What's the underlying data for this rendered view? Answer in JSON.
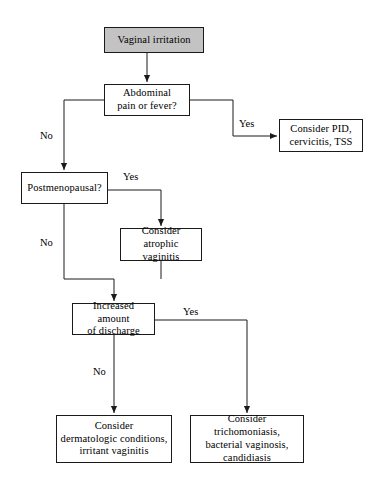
{
  "diagram": {
    "type": "clinical-decision-flowchart",
    "canvas": {
      "width": 386,
      "height": 490
    },
    "colors": {
      "start_fill": "#c3c3c3",
      "node_fill": "#ffffff",
      "stroke": "#1a1a1a",
      "text": "#000000",
      "background": "#ffffff"
    }
  },
  "nodes": [
    {
      "id": "start",
      "kind": "start",
      "text": "Vaginal irritation",
      "x": 104,
      "y": 27,
      "w": 100,
      "h": 26
    },
    {
      "id": "abdominal",
      "kind": "decision",
      "text": "Abdominal\npain or fever?",
      "x": 104,
      "y": 84,
      "w": 86,
      "h": 32
    },
    {
      "id": "consider_pid",
      "kind": "outcome",
      "text": "Consider PID,\ncervicitis, TSS",
      "x": 279,
      "y": 119,
      "w": 84,
      "h": 33
    },
    {
      "id": "postmenopausal",
      "kind": "decision",
      "text": "Postmenopausal?",
      "x": 21,
      "y": 172,
      "w": 87,
      "h": 32
    },
    {
      "id": "atrophic",
      "kind": "outcome",
      "text": "Consider\natrophic vaginitis",
      "x": 120,
      "y": 228,
      "w": 82,
      "h": 33
    },
    {
      "id": "discharge",
      "kind": "decision",
      "text": "Increased amount\nof discharge",
      "x": 72,
      "y": 303,
      "w": 83,
      "h": 32
    },
    {
      "id": "dermatologic",
      "kind": "outcome",
      "text": "Consider\ndermatologic conditions,\nirritant vaginitis",
      "x": 56,
      "y": 415,
      "w": 116,
      "h": 48
    },
    {
      "id": "trichomoniasis",
      "kind": "outcome",
      "text": "Consider trichomoniasis,\nbacterial vaginosis,\ncandidiasis",
      "x": 190,
      "y": 415,
      "w": 114,
      "h": 48
    }
  ],
  "edges": [
    {
      "id": "start-to-abdominal",
      "from": "start",
      "to": "abdominal",
      "label": "",
      "points": "147,53 147,82",
      "arrow": true
    },
    {
      "id": "abdominal-no-to-postmenopausal",
      "from": "abdominal",
      "to": "postmenopausal",
      "label": "No",
      "points": "104,100 64,100 64,170",
      "arrow": true
    },
    {
      "id": "abdominal-yes-to-pid",
      "from": "abdominal",
      "to": "consider_pid",
      "label": "Yes",
      "points": "190,100 233,100 233,136 277,136",
      "arrow": true
    },
    {
      "id": "postmenopausal-yes-to-atrophic",
      "from": "postmenopausal",
      "to": "atrophic",
      "label": "Yes",
      "points": "108,190 161,190 161,226",
      "arrow": true
    },
    {
      "id": "postmenopausal-no-to-discharge",
      "from": "postmenopausal",
      "to": "discharge",
      "label": "No",
      "points": "64,204 64,279 114,279 114,301",
      "arrow": true
    },
    {
      "id": "atrophic-to-discharge",
      "from": "atrophic",
      "to": "discharge",
      "label": "",
      "points": "161,261 161,279",
      "arrow": false
    },
    {
      "id": "discharge-no-to-dermatologic",
      "from": "discharge",
      "to": "dermatologic",
      "label": "No",
      "points": "114,335 114,413",
      "arrow": true
    },
    {
      "id": "discharge-yes-to-trichomoniasis",
      "from": "discharge",
      "to": "trichomoniasis",
      "label": "Yes",
      "points": "155,320 247,320 247,413",
      "arrow": true
    }
  ],
  "edge_labels": [
    {
      "id": "label-abdominal-no",
      "text": "No",
      "x": 40,
      "y": 131
    },
    {
      "id": "label-abdominal-yes",
      "text": "Yes",
      "x": 239,
      "y": 119
    },
    {
      "id": "label-postmenopausal-yes",
      "text": "Yes",
      "x": 123,
      "y": 172
    },
    {
      "id": "label-postmenopausal-no",
      "text": "No",
      "x": 40,
      "y": 238
    },
    {
      "id": "label-discharge-yes",
      "text": "Yes",
      "x": 183,
      "y": 307
    },
    {
      "id": "label-discharge-no",
      "text": "No",
      "x": 93,
      "y": 367
    }
  ]
}
